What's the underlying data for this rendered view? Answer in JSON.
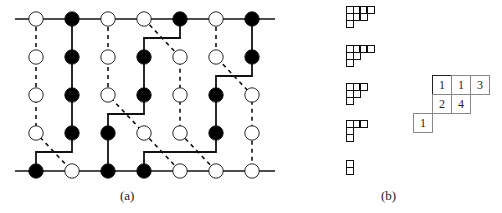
{
  "figure": {
    "captions": {
      "a": "(a)",
      "b": "(b)"
    },
    "panel_a": {
      "columns_x": [
        36,
        72,
        108,
        144,
        180,
        216,
        252
      ],
      "rows_y": [
        19,
        57,
        95,
        133,
        171
      ],
      "line_extent": [
        15,
        275
      ],
      "nodes": [
        [
          "W",
          "B",
          "W",
          "W",
          "B",
          "W",
          "B"
        ],
        [
          "W",
          "B",
          "W",
          "B",
          "W",
          "W",
          "B"
        ],
        [
          "W",
          "B",
          "W",
          "B",
          "W",
          "B",
          "W"
        ],
        [
          "W",
          "B",
          "B",
          "W",
          "W",
          "B",
          "W"
        ],
        [
          "B",
          "W",
          "B",
          "B",
          "W",
          "W",
          "W"
        ]
      ],
      "solid_paths": [
        [
          [
            72,
            19
          ],
          [
            72,
            152
          ],
          [
            36,
            152
          ],
          [
            36,
            171
          ]
        ],
        [
          [
            180,
            19
          ],
          [
            180,
            38
          ],
          [
            144,
            38
          ],
          [
            144,
            114
          ],
          [
            108,
            114
          ],
          [
            108,
            171
          ]
        ],
        [
          [
            252,
            19
          ],
          [
            252,
            76
          ],
          [
            216,
            76
          ],
          [
            216,
            152
          ],
          [
            144,
            152
          ],
          [
            144,
            171
          ]
        ]
      ],
      "dashed_paths": [
        [
          [
            36,
            19
          ],
          [
            36,
            133
          ],
          [
            72,
            171
          ]
        ],
        [
          [
            108,
            19
          ],
          [
            108,
            95
          ],
          [
            144,
            133
          ],
          [
            180,
            171
          ]
        ],
        [
          [
            144,
            19
          ],
          [
            180,
            57
          ],
          [
            180,
            133
          ],
          [
            216,
            171
          ]
        ],
        [
          [
            216,
            19
          ],
          [
            216,
            57
          ],
          [
            252,
            95
          ],
          [
            252,
            171
          ]
        ]
      ],
      "colors": {
        "stroke": "#111111",
        "filled_node": "#000000",
        "open_node": "#ffffff"
      }
    },
    "panel_b": {
      "small_tableaux": [
        {
          "rows": [
            4,
            3,
            1
          ],
          "thick_after": [
            [
              0,
              1
            ],
            [
              0,
              2
            ],
            [
              1,
              1
            ]
          ]
        },
        {
          "rows": [
            4,
            2,
            1
          ],
          "thick_after": [
            [
              0,
              1
            ],
            [
              0,
              2
            ]
          ]
        },
        {
          "rows": [
            3,
            2,
            1
          ],
          "thick_after": [
            [
              0,
              1
            ]
          ]
        },
        {
          "rows": [
            3,
            1,
            1
          ],
          "thick_after": [
            [
              0,
              1
            ]
          ]
        },
        {
          "rows": [
            1,
            1
          ],
          "thick_after": []
        }
      ],
      "skew_tableau": {
        "rows": [
          {
            "offset": 1,
            "values": [
              "1",
              "1",
              "3"
            ]
          },
          {
            "offset": 1,
            "values": [
              "2",
              "4"
            ]
          },
          {
            "offset": 0,
            "values": [
              "1"
            ]
          }
        ]
      }
    }
  }
}
